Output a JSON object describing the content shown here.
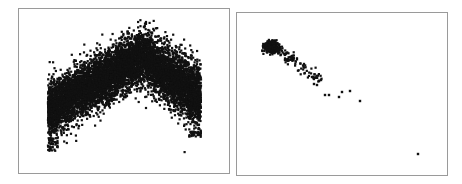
{
  "colors": {
    "points": "#111111",
    "frame": "#9a9a9a",
    "background": "#ffffff"
  },
  "chart_data": [
    {
      "type": "scatter",
      "title": "",
      "xlabel": "",
      "ylabel": "",
      "grid": false,
      "legend": null,
      "description": "Dense inverted-V (tent shaped) point cloud; band rises from left to a peak near center-right then descends to the right.",
      "x_range_px": [
        47,
        200
      ],
      "peak_px": [
        140,
        30
      ],
      "band": {
        "left_edge": {
          "x": 47,
          "top": 82,
          "bottom": 136,
          "outlier_min_y": 150
        },
        "peak": {
          "x": 140,
          "top": 30,
          "bottom": 80
        },
        "right_edge": {
          "x": 200,
          "top": 65,
          "bottom": 130,
          "outlier_min_y": 136
        }
      },
      "point_count_estimate": 8000
    },
    {
      "type": "scatter",
      "title": "",
      "xlabel": "",
      "ylabel": "",
      "grid": false,
      "legend": null,
      "description": "Small dense cluster in upper-left trailing diagonally down-right, with sparse outliers and one far point in bottom-right.",
      "cluster": {
        "center_px": [
          270,
          46
        ],
        "spread": [
          6,
          5
        ]
      },
      "trail": {
        "from_px": [
          270,
          44
        ],
        "to_px": [
          320,
          80
        ],
        "width": 8
      },
      "outliers_px": [
        [
          324,
          94
        ],
        [
          328,
          94
        ],
        [
          338,
          96
        ],
        [
          341,
          91
        ],
        [
          349,
          90
        ],
        [
          359,
          100
        ],
        [
          311,
          76
        ],
        [
          318,
          80
        ],
        [
          313,
          83
        ],
        [
          316,
          84
        ],
        [
          320,
          79
        ],
        [
          417,
          153
        ]
      ],
      "point_count_estimate": 350
    }
  ]
}
